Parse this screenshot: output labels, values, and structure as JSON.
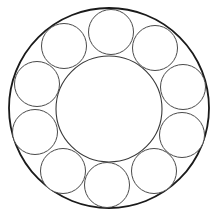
{
  "diagram": {
    "title": "",
    "type": "packed-circles-ring",
    "background": "#ffffff",
    "outer_circle": {
      "cx": 109,
      "cy": 108,
      "r": 100,
      "stroke": "#1a1a1a"
    },
    "inner_circle": {
      "cx": 109,
      "cy": 109,
      "r": 53,
      "stroke": "#3a3a3a"
    },
    "small_circle_count": 10,
    "small_circles": [
      {
        "id": "top",
        "cx": 111,
        "cy": 32,
        "r": 22.5
      },
      {
        "id": "upper-right",
        "cx": 155,
        "cy": 48,
        "r": 22.5
      },
      {
        "id": "right-upper",
        "cx": 183,
        "cy": 87,
        "r": 22.5
      },
      {
        "id": "right-lower",
        "cx": 182,
        "cy": 135,
        "r": 22.5
      },
      {
        "id": "lower-right",
        "cx": 154,
        "cy": 171,
        "r": 22.5
      },
      {
        "id": "bottom",
        "cx": 107,
        "cy": 185,
        "r": 22.5
      },
      {
        "id": "lower-left",
        "cx": 63,
        "cy": 171,
        "r": 22.5
      },
      {
        "id": "left-lower",
        "cx": 35,
        "cy": 132,
        "r": 22.5
      },
      {
        "id": "left-upper",
        "cx": 37,
        "cy": 84,
        "r": 22.5
      },
      {
        "id": "upper-left",
        "cx": 64,
        "cy": 46,
        "r": 22.5
      }
    ]
  }
}
